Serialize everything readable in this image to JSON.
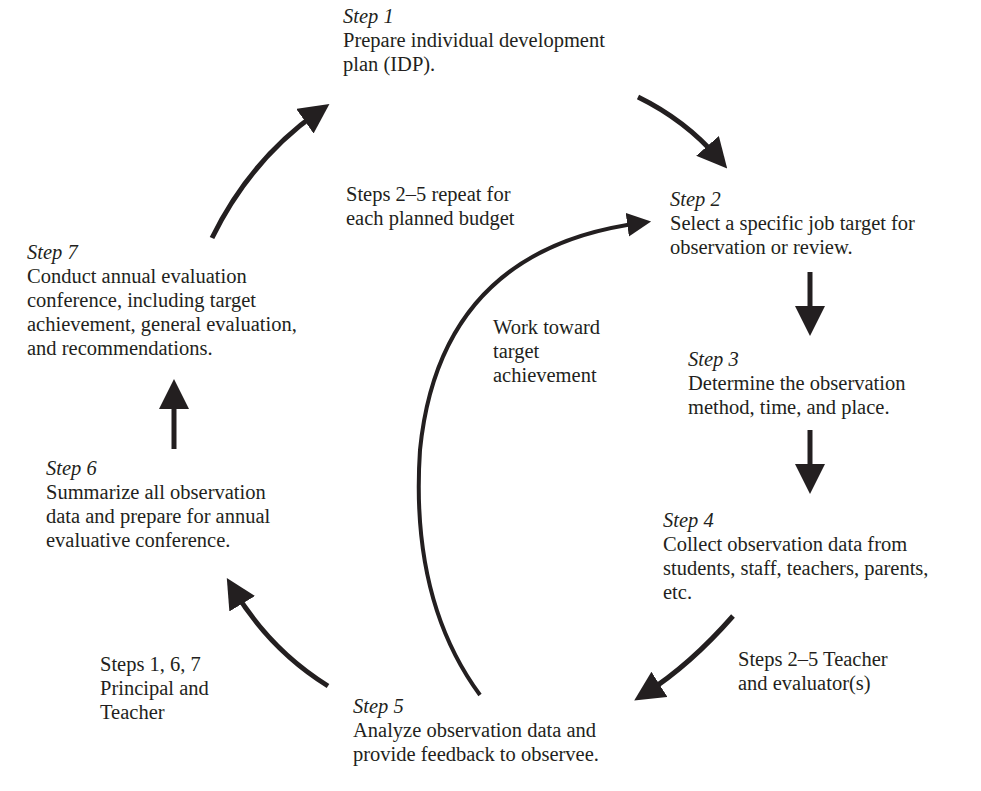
{
  "diagram": {
    "type": "cycle",
    "colors": {
      "text": "#231f20",
      "arrow": "#231f20",
      "background": "#ffffff"
    },
    "steps": [
      {
        "id": "step1",
        "label": "Step 1",
        "lines": [
          "Prepare individual development",
          "plan (IDP)."
        ]
      },
      {
        "id": "step2",
        "label": "Step 2",
        "lines": [
          "Select a specific job target for",
          "observation or review."
        ]
      },
      {
        "id": "step3",
        "label": "Step 3",
        "lines": [
          "Determine the observation",
          "method, time, and place."
        ]
      },
      {
        "id": "step4",
        "label": "Step 4",
        "lines": [
          "Collect observation data from",
          "students, staff, teachers, parents,",
          "etc."
        ]
      },
      {
        "id": "step5",
        "label": "Step 5",
        "lines": [
          "Analyze observation data and",
          "provide feedback to observee."
        ]
      },
      {
        "id": "step6",
        "label": "Step 6",
        "lines": [
          "Summarize all observation",
          "data and prepare for annual",
          "evaluative conference."
        ]
      },
      {
        "id": "step7",
        "label": "Step 7",
        "lines": [
          "Conduct annual evaluation",
          "conference, including target",
          "achievement, general evaluation,",
          "and recommendations."
        ]
      }
    ],
    "notes": [
      {
        "id": "repeat",
        "lines": [
          "Steps 2–5  repeat for",
          "each planned budget"
        ]
      },
      {
        "id": "work",
        "lines": [
          "Work toward",
          "target",
          "achievement"
        ]
      },
      {
        "id": "teacher-evaluator",
        "lines": [
          "Steps 2–5  Teacher",
          "and evaluator(s)"
        ]
      },
      {
        "id": "principal-teacher",
        "lines": [
          "Steps 1, 6, 7",
          "Principal and",
          "Teacher"
        ]
      }
    ],
    "edges": [
      {
        "from": "step1",
        "to": "step2"
      },
      {
        "from": "step2",
        "to": "step3"
      },
      {
        "from": "step3",
        "to": "step4"
      },
      {
        "from": "step4",
        "to": "step5"
      },
      {
        "from": "step5",
        "to": "step6"
      },
      {
        "from": "step6",
        "to": "step7"
      },
      {
        "from": "step7",
        "to": "step1"
      },
      {
        "from": "step5",
        "to": "step2",
        "label": "Work toward target achievement"
      }
    ]
  }
}
